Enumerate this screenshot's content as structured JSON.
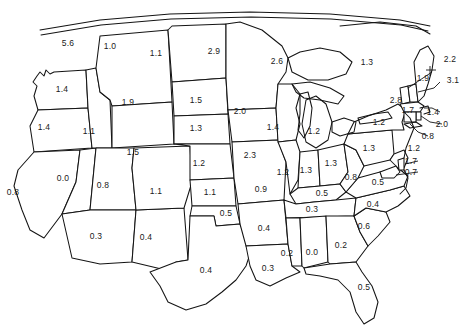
{
  "map": {
    "title": "United States state value map",
    "description": "Outline map of the contiguous United States with one numeric value printed inside or beside each state",
    "value_format": "one decimal place",
    "outline_color": "#141414",
    "background_color": "#ffffff",
    "label_color": "#1a1a1a"
  },
  "chart_data": {
    "type": "map",
    "title": "",
    "xlabel": "",
    "ylabel": "",
    "categories": [
      "WA",
      "OR",
      "CA",
      "NV",
      "ID",
      "MT",
      "WY",
      "UT",
      "AZ",
      "NM",
      "CO",
      "ND",
      "SD",
      "NE",
      "KS",
      "OK",
      "TX",
      "MN",
      "IA",
      "MO",
      "AR",
      "LA",
      "WI",
      "IL",
      "MI",
      "IN",
      "OH",
      "KY",
      "TN",
      "MS",
      "AL",
      "GA",
      "FL",
      "SC",
      "NC",
      "VA",
      "WV",
      "PA",
      "NY",
      "ME",
      "VT",
      "NH",
      "MA",
      "RI",
      "CT",
      "NJ",
      "DE",
      "MD"
    ],
    "values": [
      1.4,
      1.4,
      0.8,
      0.0,
      1.1,
      1.9,
      1.5,
      0.8,
      0.3,
      0.4,
      1.1,
      1.5,
      1.3,
      1.2,
      1.1,
      0.5,
      0.4,
      2.6,
      2.3,
      0.9,
      0.4,
      0.3,
      1.4,
      1.2,
      1.2,
      1.3,
      1.3,
      0.5,
      0.3,
      0.2,
      0.0,
      0.2,
      0.5,
      0.6,
      0.4,
      0.5,
      0.8,
      1.3,
      2.8,
      1.9,
      2.2,
      3.1,
      1.4,
      2.0,
      0.8,
      1.2,
      1.7,
      0.7
    ],
    "top_border_values": [
      5.6,
      1.0,
      1.1,
      2.9
    ],
    "northeast_small_value": 1.7,
    "legend": [],
    "grid": false
  },
  "labels": [
    {
      "id": "top-1",
      "value": "5.6",
      "x": 68,
      "y": 43,
      "leader": false
    },
    {
      "id": "top-2",
      "value": "1.0",
      "x": 110,
      "y": 46,
      "leader": false
    },
    {
      "id": "top-3",
      "value": "1.1",
      "x": 156,
      "y": 53,
      "leader": false
    },
    {
      "id": "top-4",
      "value": "2.9",
      "x": 214,
      "y": 51,
      "leader": false
    },
    {
      "id": "mn",
      "value": "2.6",
      "x": 277,
      "y": 61,
      "leader": false
    },
    {
      "id": "wi-top",
      "value": "1.3",
      "x": 367,
      "y": 62,
      "leader": false
    },
    {
      "id": "vt",
      "value": "2.2",
      "x": 450,
      "y": 59,
      "leader": true
    },
    {
      "id": "me",
      "value": "1.9",
      "x": 423,
      "y": 78,
      "leader": false
    },
    {
      "id": "nh",
      "value": "3.1",
      "x": 453,
      "y": 80,
      "leader": true
    },
    {
      "id": "wa",
      "value": "1.4",
      "x": 62,
      "y": 89,
      "leader": false
    },
    {
      "id": "mt",
      "value": "1.9",
      "x": 128,
      "y": 102,
      "leader": false
    },
    {
      "id": "nd",
      "value": "1.5",
      "x": 196,
      "y": 100,
      "leader": false
    },
    {
      "id": "ny",
      "value": "2.8",
      "x": 396,
      "y": 100,
      "leader": false
    },
    {
      "id": "mn2",
      "value": "2.0",
      "x": 240,
      "y": 111,
      "leader": false
    },
    {
      "id": "ne-sm",
      "value": "1.7",
      "x": 408,
      "y": 110,
      "leader": false
    },
    {
      "id": "ma",
      "value": "1.4",
      "x": 433,
      "y": 112,
      "leader": true
    },
    {
      "id": "or",
      "value": "1.4",
      "x": 44,
      "y": 127,
      "leader": false
    },
    {
      "id": "id",
      "value": "1.1",
      "x": 89,
      "y": 131,
      "leader": false
    },
    {
      "id": "sd",
      "value": "1.3",
      "x": 196,
      "y": 128,
      "leader": false
    },
    {
      "id": "wi",
      "value": "1.4",
      "x": 273,
      "y": 127,
      "leader": false
    },
    {
      "id": "mi",
      "value": "1.2",
      "x": 314,
      "y": 131,
      "leader": false
    },
    {
      "id": "oh",
      "value": "1.2",
      "x": 379,
      "y": 122,
      "leader": false
    },
    {
      "id": "ri",
      "value": "2.0",
      "x": 442,
      "y": 124,
      "leader": true
    },
    {
      "id": "ct",
      "value": "0.8",
      "x": 428,
      "y": 136,
      "leader": true
    },
    {
      "id": "wy",
      "value": "1.5",
      "x": 133,
      "y": 152,
      "leader": false
    },
    {
      "id": "ne",
      "value": "1.2",
      "x": 199,
      "y": 163,
      "leader": false
    },
    {
      "id": "ia",
      "value": "2.3",
      "x": 250,
      "y": 155,
      "leader": false
    },
    {
      "id": "il",
      "value": "1.2",
      "x": 283,
      "y": 172,
      "leader": false
    },
    {
      "id": "in",
      "value": "1.3",
      "x": 306,
      "y": 170,
      "leader": false
    },
    {
      "id": "oh2",
      "value": "1.3",
      "x": 331,
      "y": 163,
      "leader": false
    },
    {
      "id": "pa",
      "value": "1.3",
      "x": 369,
      "y": 148,
      "leader": false
    },
    {
      "id": "nj",
      "value": "1.2",
      "x": 414,
      "y": 148,
      "leader": false
    },
    {
      "id": "de",
      "value": "1.7",
      "x": 411,
      "y": 161,
      "leader": true
    },
    {
      "id": "md",
      "value": "0.7",
      "x": 411,
      "y": 172,
      "leader": true
    },
    {
      "id": "wv",
      "value": "0.8",
      "x": 351,
      "y": 177,
      "leader": false
    },
    {
      "id": "va",
      "value": "0.5",
      "x": 378,
      "y": 182,
      "leader": false
    },
    {
      "id": "ca",
      "value": "0.8",
      "x": 13,
      "y": 192,
      "leader": false
    },
    {
      "id": "nv",
      "value": "0.0",
      "x": 63,
      "y": 178,
      "leader": false
    },
    {
      "id": "ut",
      "value": "0.8",
      "x": 103,
      "y": 185,
      "leader": false
    },
    {
      "id": "co",
      "value": "1.1",
      "x": 156,
      "y": 191,
      "leader": false
    },
    {
      "id": "ks",
      "value": "1.1",
      "x": 210,
      "y": 192,
      "leader": false
    },
    {
      "id": "mo",
      "value": "0.9",
      "x": 261,
      "y": 189,
      "leader": false
    },
    {
      "id": "ky",
      "value": "0.5",
      "x": 322,
      "y": 193,
      "leader": false
    },
    {
      "id": "nc",
      "value": "0.4",
      "x": 373,
      "y": 204,
      "leader": false
    },
    {
      "id": "tn",
      "value": "0.3",
      "x": 312,
      "y": 209,
      "leader": false
    },
    {
      "id": "ok",
      "value": "0.5",
      "x": 226,
      "y": 213,
      "leader": false
    },
    {
      "id": "ar",
      "value": "0.4",
      "x": 264,
      "y": 228,
      "leader": false
    },
    {
      "id": "sc",
      "value": "0.6",
      "x": 364,
      "y": 226,
      "leader": false
    },
    {
      "id": "az",
      "value": "0.3",
      "x": 96,
      "y": 236,
      "leader": false
    },
    {
      "id": "nm",
      "value": "0.4",
      "x": 146,
      "y": 237,
      "leader": false
    },
    {
      "id": "ms",
      "value": "0.2",
      "x": 287,
      "y": 253,
      "leader": false
    },
    {
      "id": "al",
      "value": "0.0",
      "x": 312,
      "y": 252,
      "leader": false
    },
    {
      "id": "ga",
      "value": "0.2",
      "x": 341,
      "y": 245,
      "leader": false
    },
    {
      "id": "tx",
      "value": "0.4",
      "x": 206,
      "y": 270,
      "leader": false
    },
    {
      "id": "la",
      "value": "0.3",
      "x": 268,
      "y": 268,
      "leader": false
    },
    {
      "id": "fl",
      "value": "0.5",
      "x": 364,
      "y": 287,
      "leader": false
    }
  ]
}
